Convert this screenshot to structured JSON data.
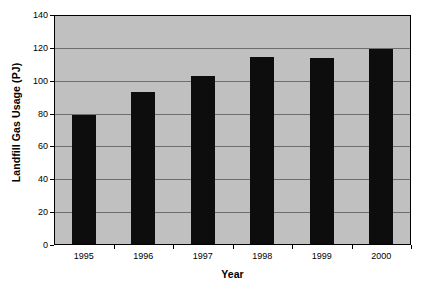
{
  "chart_data": {
    "type": "bar",
    "title": "",
    "xlabel": "Year",
    "ylabel": "Landfill Gas Usage (PJ)",
    "categories": [
      "1995",
      "1996",
      "1997",
      "1998",
      "1999",
      "2000"
    ],
    "values": [
      78.5,
      92.5,
      102,
      114,
      113.5,
      119
    ],
    "ylim": [
      0,
      140
    ],
    "yticks": [
      0,
      20,
      40,
      60,
      80,
      100,
      120,
      140
    ],
    "ytick_labels": [
      "0",
      "20",
      "40",
      "60",
      "80",
      "100",
      "120",
      "140"
    ],
    "grid": true,
    "legend": false,
    "legend_position": "none",
    "series": [
      {
        "name": "Landfill Gas Usage",
        "values": [
          78.5,
          92.5,
          102,
          114,
          113.5,
          119
        ]
      }
    ],
    "colors": {
      "bar": "#0d0d0d",
      "plot_background": "#c0c0c0",
      "gridline": "#6e6e6e",
      "axis": "#000000",
      "page_background": "#ffffff",
      "text": "#000000"
    }
  }
}
